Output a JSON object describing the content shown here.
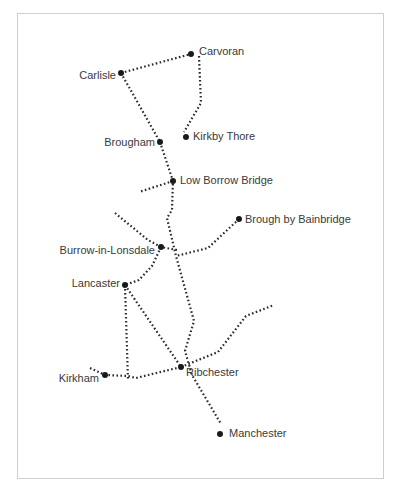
{
  "map": {
    "frame": {
      "x": 17,
      "y": 13,
      "width": 367,
      "height": 466,
      "border_color": "#cfcfcf"
    },
    "colors": {
      "route": "#2b2b2b",
      "dot": "#1a1a1a",
      "label": "#3a3a3a",
      "background": "#ffffff"
    },
    "sites": [
      {
        "id": "carlisle",
        "label": "Carlisle",
        "x": 121,
        "y": 73,
        "label_x": 116,
        "label_y": 79,
        "anchor": "end"
      },
      {
        "id": "carvoran",
        "label": "Carvoran",
        "x": 191,
        "y": 54,
        "label_x": 199,
        "label_y": 55,
        "anchor": "start"
      },
      {
        "id": "kirkby-thore",
        "label": "Kirkby Thore",
        "x": 186,
        "y": 137,
        "label_x": 193,
        "label_y": 140,
        "anchor": "start"
      },
      {
        "id": "brougham",
        "label": "Brougham",
        "x": 160,
        "y": 142,
        "label_x": 155,
        "label_y": 146,
        "anchor": "end"
      },
      {
        "id": "low-borrow-bridge",
        "label": "Low Borrow Bridge",
        "x": 173,
        "y": 181,
        "label_x": 180,
        "label_y": 184,
        "anchor": "start"
      },
      {
        "id": "brough-by-bainbridge",
        "label": "Brough by Bainbridge",
        "x": 239,
        "y": 219,
        "label_x": 245,
        "label_y": 223,
        "anchor": "start"
      },
      {
        "id": "burrow-in-lonsdale",
        "label": "Burrow-in-Lonsdale",
        "x": 161,
        "y": 247,
        "label_x": 155,
        "label_y": 254,
        "anchor": "end"
      },
      {
        "id": "lancaster",
        "label": "Lancaster",
        "x": 125,
        "y": 285,
        "label_x": 120,
        "label_y": 287,
        "anchor": "end"
      },
      {
        "id": "ribchester",
        "label": "Ribchester",
        "x": 181,
        "y": 367,
        "label_x": 186,
        "label_y": 376,
        "anchor": "start"
      },
      {
        "id": "kirkham",
        "label": "Kirkham",
        "x": 105,
        "y": 375,
        "label_x": 99,
        "label_y": 382,
        "anchor": "end"
      },
      {
        "id": "manchester",
        "label": "Manchester",
        "x": 220,
        "y": 434,
        "label_x": 229,
        "label_y": 437,
        "anchor": "start"
      }
    ],
    "routes": [
      {
        "id": "carlisle-carvoran",
        "points": "121,73 191,54"
      },
      {
        "id": "carvoran-kirkby-thore",
        "points": "199,56 201,103 184,132"
      },
      {
        "id": "carlisle-brougham",
        "points": "121,73 160,142"
      },
      {
        "id": "brougham-south-main",
        "points": "160,142 173,181 172,210 167,218 176,256 194,321 185,351 192,375 221,424"
      },
      {
        "id": "low-borrow-bridge-west",
        "points": "173,181 139,192"
      },
      {
        "id": "northwest-burrow",
        "points": "115,213 148,240 161,247 177,250"
      },
      {
        "id": "bainbridge-main",
        "points": "239,219 208,248 176,256"
      },
      {
        "id": "burrow-lancaster",
        "points": "161,247 152,266 139,280 125,285"
      },
      {
        "id": "lancaster-ribchester",
        "points": "125,285 181,367"
      },
      {
        "id": "lancaster-south",
        "points": "125,285 128,381"
      },
      {
        "id": "kirkham-ribchester",
        "points": "90,368 105,375 128,376 136,378 181,367"
      },
      {
        "id": "ribchester-east",
        "points": "181,367 218,352 246,316 274,305"
      }
    ]
  }
}
